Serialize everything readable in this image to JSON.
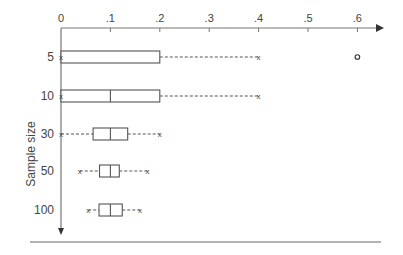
{
  "chart_data": {
    "type": "boxplot",
    "title": "",
    "xlabel": "",
    "ylabel": "Sample size",
    "xlim": [
      0,
      0.65
    ],
    "x_ticks": [
      "0",
      ".1",
      ".2",
      ".3",
      ".4",
      ".5",
      ".6"
    ],
    "x_tick_values": [
      0,
      0.1,
      0.2,
      0.3,
      0.4,
      0.5,
      0.6
    ],
    "categories": [
      "5",
      "10",
      "30",
      "50",
      "100"
    ],
    "series": [
      {
        "name": "5",
        "min": 0,
        "q1": 0,
        "median": 0,
        "q3": 0.2,
        "max": 0.4,
        "outliers": [
          0.6
        ]
      },
      {
        "name": "10",
        "min": 0,
        "q1": 0,
        "median": 0.1,
        "q3": 0.2,
        "max": 0.4,
        "outliers": []
      },
      {
        "name": "30",
        "min": 0,
        "q1": 0.065,
        "median": 0.1,
        "q3": 0.135,
        "max": 0.2,
        "outliers": []
      },
      {
        "name": "50",
        "min": 0.038,
        "q1": 0.078,
        "median": 0.1,
        "q3": 0.118,
        "max": 0.175,
        "outliers": []
      },
      {
        "name": "100",
        "min": 0.055,
        "q1": 0.077,
        "median": 0.1,
        "q3": 0.124,
        "max": 0.16,
        "outliers": []
      }
    ],
    "grid": false,
    "legend": null
  },
  "colors": {
    "axis": "#777777",
    "box": "#555555",
    "text": "#444444"
  }
}
